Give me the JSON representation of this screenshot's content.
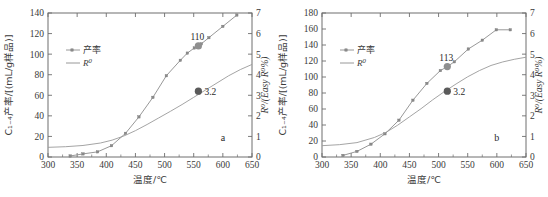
{
  "figure": {
    "panels": [
      {
        "letter": "a",
        "xlabel": "温度/℃",
        "ylabel_left": "C₁₋₄产率/[(mL/g样品)]",
        "ylabel_right": "R⁰/(Easy R⁰%)",
        "legend": [
          {
            "key": "yield",
            "label": "产率",
            "style": "line-marker"
          },
          {
            "key": "ro",
            "label": "R⁰",
            "style": "line"
          }
        ],
        "xticks": [
          300,
          350,
          400,
          450,
          500,
          550,
          600,
          650
        ],
        "yticks_left": [
          0,
          20,
          40,
          60,
          80,
          100,
          120,
          140
        ],
        "yticks_right": [
          0,
          1,
          2,
          3,
          4,
          5,
          6,
          7
        ],
        "xlim": [
          300,
          650
        ],
        "ylim_left": [
          0,
          140
        ],
        "ylim_right": [
          0,
          7
        ],
        "annotations": [
          {
            "name": "yield-highlight",
            "text": "110",
            "x": 558,
            "y": 108,
            "axis": "left"
          },
          {
            "name": "ro-highlight",
            "text": "3.2",
            "x": 558,
            "y": 3.2,
            "axis": "right"
          }
        ]
      },
      {
        "letter": "b",
        "xlabel": "温度/℃",
        "ylabel_left": "C₁₋₄产率/[(mL/g样品)]",
        "ylabel_right": "R⁰/(Easy R⁰%)",
        "legend": [
          {
            "key": "yield",
            "label": "产率",
            "style": "line-marker"
          },
          {
            "key": "ro",
            "label": "R⁰",
            "style": "line"
          }
        ],
        "xticks": [
          300,
          350,
          400,
          450,
          500,
          550,
          600,
          650
        ],
        "yticks_left": [
          0,
          20,
          40,
          60,
          80,
          100,
          120,
          140,
          160,
          180
        ],
        "yticks_right": [
          0,
          1,
          2,
          3,
          4,
          5,
          6,
          7
        ],
        "xlim": [
          300,
          650
        ],
        "ylim_left": [
          0,
          180
        ],
        "ylim_right": [
          0,
          7
        ],
        "annotations": [
          {
            "name": "yield-highlight",
            "text": "113",
            "x": 515,
            "y": 113,
            "axis": "left"
          },
          {
            "name": "ro-highlight",
            "text": "3.2",
            "x": 515,
            "y": 3.2,
            "axis": "right"
          }
        ]
      }
    ]
  },
  "chart_data": [
    {
      "type": "line",
      "panel": "a",
      "title": "",
      "xlabel": "温度/℃",
      "ylabel": "C₁₋₄产率/[(mL/g样品)]",
      "ylabel_secondary": "R⁰/(Easy R⁰%)",
      "xlim": [
        300,
        650
      ],
      "ylim": [
        0,
        140
      ],
      "ylim_secondary": [
        0,
        7
      ],
      "grid": false,
      "legend_position": "upper-left",
      "series": [
        {
          "name": "产率",
          "axis": "left",
          "marker": true,
          "x": [
            338,
            360,
            385,
            409,
            433,
            456,
            480,
            503,
            527,
            539,
            551,
            563,
            576,
            600,
            624
          ],
          "y": [
            1,
            3,
            5,
            11,
            23,
            39,
            58,
            79,
            94,
            101,
            106,
            110,
            116,
            127,
            138
          ]
        },
        {
          "name": "R⁰",
          "axis": "right",
          "marker": false,
          "x": [
            300,
            330,
            360,
            390,
            410,
            430,
            450,
            470,
            490,
            510,
            530,
            550,
            570,
            590,
            610,
            630,
            650
          ],
          "y": [
            0.47,
            0.5,
            0.56,
            0.68,
            0.82,
            1.02,
            1.28,
            1.58,
            1.9,
            2.22,
            2.55,
            2.9,
            3.25,
            3.6,
            3.95,
            4.25,
            4.5
          ]
        }
      ],
      "annotations": [
        {
          "text": "110",
          "x": 558,
          "y": 108,
          "axis": "left"
        },
        {
          "text": "3.2",
          "x": 558,
          "y": 3.2,
          "axis": "right"
        },
        {
          "text": "a",
          "x": 600,
          "y": 16,
          "axis": "left"
        }
      ]
    },
    {
      "type": "line",
      "panel": "b",
      "title": "",
      "xlabel": "温度/℃",
      "ylabel": "C₁₋₄产率/[(mL/g样品)]",
      "ylabel_secondary": "R⁰/(Easy R⁰%)",
      "xlim": [
        300,
        650
      ],
      "ylim": [
        0,
        180
      ],
      "ylim_secondary": [
        0,
        7
      ],
      "grid": false,
      "legend_position": "upper-left",
      "series": [
        {
          "name": "产率",
          "axis": "left",
          "marker": true,
          "x": [
            336,
            360,
            384,
            408,
            432,
            456,
            480,
            503,
            515,
            527,
            551,
            575,
            599,
            623
          ],
          "y": [
            2,
            7,
            16,
            29,
            46,
            71,
            92,
            108,
            113,
            119,
            135,
            146,
            159,
            159
          ]
        },
        {
          "name": "R⁰",
          "axis": "right",
          "marker": false,
          "x": [
            300,
            330,
            360,
            390,
            410,
            430,
            450,
            470,
            490,
            510,
            530,
            550,
            570,
            590,
            610,
            630,
            650
          ],
          "y": [
            0.55,
            0.6,
            0.7,
            0.95,
            1.2,
            1.55,
            1.95,
            2.35,
            2.78,
            3.18,
            3.55,
            3.9,
            4.2,
            4.45,
            4.62,
            4.75,
            4.85
          ]
        }
      ],
      "annotations": [
        {
          "text": "113",
          "x": 515,
          "y": 113,
          "axis": "left"
        },
        {
          "text": "3.2",
          "x": 515,
          "y": 3.2,
          "axis": "right"
        },
        {
          "text": "b",
          "x": 600,
          "y": 20,
          "axis": "left"
        }
      ]
    }
  ]
}
